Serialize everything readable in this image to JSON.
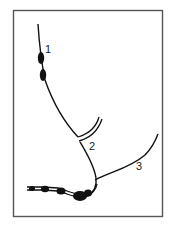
{
  "figure": {
    "frame": {
      "x": 13,
      "y": 10,
      "width": 150,
      "height": 207,
      "stroke": "#555555"
    },
    "ink_color": "#111111",
    "labels": [
      {
        "id": "1",
        "text": "1",
        "x": 45,
        "y": 44
      },
      {
        "id": "2",
        "text": "2",
        "x": 89,
        "y": 141
      },
      {
        "id": "3",
        "text": "3",
        "x": 136,
        "y": 161
      }
    ],
    "structures": [
      {
        "id": "strand-1",
        "label": "1",
        "description": "upper strand with two dark beads"
      },
      {
        "id": "strand-2",
        "label": "2",
        "description": "middle strand from bifurcation down to junction"
      },
      {
        "id": "strand-3",
        "label": "3",
        "description": "right strand curving upward"
      },
      {
        "id": "double-branch",
        "description": "short double-lined branch at bifurcation"
      },
      {
        "id": "beaded-bundle",
        "description": "beaded double strand extending left from junction"
      }
    ]
  }
}
